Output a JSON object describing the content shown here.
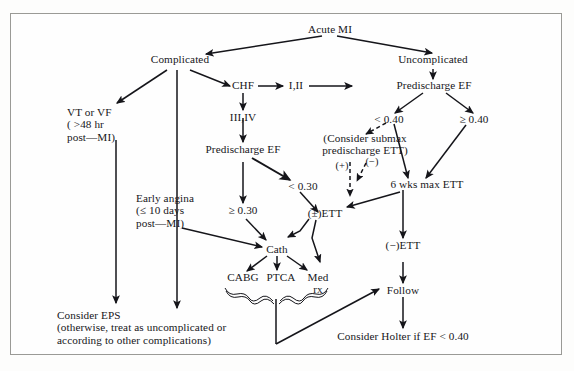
{
  "figure": {
    "type": "flowchart",
    "border_color": "#9a9a96",
    "text_color": "#16161a",
    "background": "#fefefe"
  },
  "nodes": {
    "acute_mi": "Acute MI",
    "complicated": "Complicated",
    "uncomplicated": "Uncomplicated",
    "chf": "CHF",
    "class_i_ii": "I,II",
    "class_iii_iv": "III,IV",
    "predischarge_ef_right": "Predischarge EF",
    "predischarge_ef_left": "Predischarge EF",
    "vt_vf": "VT or VF\n( >48 hr\npost—MI)",
    "ef_lt_040": "< 0.40",
    "ef_ge_040": "≥ 0.40",
    "consider_submax": "(Consider submax\npredischarge ETT)",
    "plus_label": "(+)",
    "minus_label": "(−)",
    "six_wks_max_ett": "6 wks max ETT",
    "ef_ge_030": "≥ 0.30",
    "ef_lt_030": "< 0.30",
    "early_angina": "Early angina\n(≤ 10 days\npost—MI)",
    "pm_ett": "(±)ETT",
    "neg_ett": "(−)ETT",
    "cath": "Cath",
    "cabg": "CABG",
    "ptca": "PTCA",
    "med_rx": "Med\nrx",
    "follow": "Follow",
    "consider_eps": "Consider EPS\n(otherwise, treat as uncomplicated or\naccording to other complications)",
    "consider_holter": "Consider Holter if EF < 0.40"
  },
  "edges": [
    {
      "from": "acute_mi",
      "to": "complicated",
      "style": "solid"
    },
    {
      "from": "acute_mi",
      "to": "uncomplicated",
      "style": "solid"
    },
    {
      "from": "complicated",
      "to": "vt_vf",
      "style": "solid"
    },
    {
      "from": "complicated",
      "to": "consider_eps",
      "style": "solid"
    },
    {
      "from": "complicated",
      "to": "chf",
      "style": "solid"
    },
    {
      "from": "chf",
      "to": "class_i_ii",
      "style": "solid"
    },
    {
      "from": "chf",
      "to": "class_iii_iv",
      "style": "solid"
    },
    {
      "from": "class_i_ii",
      "to": "predischarge_ef_right",
      "style": "solid"
    },
    {
      "from": "uncomplicated",
      "to": "predischarge_ef_right",
      "style": "solid"
    },
    {
      "from": "class_iii_iv",
      "to": "predischarge_ef_left",
      "style": "solid"
    },
    {
      "from": "predischarge_ef_right",
      "to": "ef_lt_040",
      "style": "solid"
    },
    {
      "from": "predischarge_ef_right",
      "to": "ef_ge_040",
      "style": "solid"
    },
    {
      "from": "ef_lt_040",
      "to": "consider_submax",
      "style": "dashed"
    },
    {
      "from": "ef_lt_040",
      "to": "six_wks_max_ett",
      "style": "solid"
    },
    {
      "from": "ef_ge_040",
      "to": "six_wks_max_ett",
      "style": "solid"
    },
    {
      "from": "consider_submax",
      "to": "pm_ett",
      "style": "dashed",
      "label": "(+)"
    },
    {
      "from": "consider_submax",
      "to": "minus_branch",
      "style": "dashed",
      "label": "(−)"
    },
    {
      "from": "predischarge_ef_left",
      "to": "ef_ge_030",
      "style": "solid"
    },
    {
      "from": "predischarge_ef_left",
      "to": "ef_lt_030",
      "style": "solid"
    },
    {
      "from": "ef_ge_030",
      "to": "cath",
      "style": "solid"
    },
    {
      "from": "ef_lt_030",
      "to": "pm_ett",
      "style": "solid"
    },
    {
      "from": "early_angina",
      "to": "cath",
      "style": "solid"
    },
    {
      "from": "vt_vf",
      "to": "consider_eps",
      "style": "solid"
    },
    {
      "from": "pm_ett",
      "to": "cath",
      "style": "solid"
    },
    {
      "from": "pm_ett",
      "to": "med_rx",
      "style": "solid"
    },
    {
      "from": "six_wks_max_ett",
      "to": "pm_ett",
      "style": "solid"
    },
    {
      "from": "six_wks_max_ett",
      "to": "neg_ett",
      "style": "solid"
    },
    {
      "from": "neg_ett",
      "to": "follow",
      "style": "solid"
    },
    {
      "from": "cath",
      "to": "cabg",
      "style": "solid"
    },
    {
      "from": "cath",
      "to": "ptca",
      "style": "solid"
    },
    {
      "from": "cath",
      "to": "med_rx",
      "style": "solid"
    },
    {
      "from": "brace",
      "to": "follow",
      "style": "solid"
    },
    {
      "from": "follow",
      "to": "consider_holter",
      "style": "solid"
    }
  ]
}
